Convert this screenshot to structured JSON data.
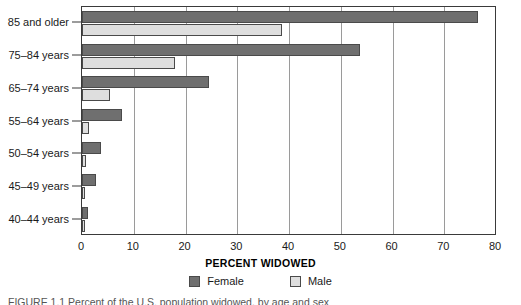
{
  "chart_data": {
    "type": "bar",
    "orientation": "horizontal",
    "title": "",
    "xlabel": "PERCENT WIDOWED",
    "ylabel": "",
    "xlim": [
      0,
      80
    ],
    "xticks": [
      0,
      10,
      20,
      30,
      40,
      50,
      60,
      70,
      80
    ],
    "grid": "vertical",
    "legend_position": "bottom",
    "categories": [
      "85 and older",
      "75–84 years",
      "65–74 years",
      "55–64 years",
      "50–54 years",
      "45–49 years",
      "40–44 years"
    ],
    "series": [
      {
        "name": "Female",
        "color": "#6f6f6f",
        "values": [
          76.5,
          53.8,
          24.6,
          7.7,
          3.7,
          2.7,
          1.2
        ]
      },
      {
        "name": "Male",
        "color": "#dedede",
        "values": [
          38.7,
          18.0,
          5.4,
          1.4,
          0.7,
          0.6,
          0.5
        ]
      }
    ]
  },
  "legend": {
    "items": [
      {
        "label": "Female",
        "swatch": "female"
      },
      {
        "label": "Male",
        "swatch": "male"
      }
    ]
  },
  "caption": {
    "text": "FIGURE 1.1  Percent of the U.S. population widowed, by age and sex"
  },
  "colors": {
    "female": "#6f6f6f",
    "male": "#dedede",
    "axis": "#3a3a3a",
    "grid": "#9a9a9a"
  }
}
